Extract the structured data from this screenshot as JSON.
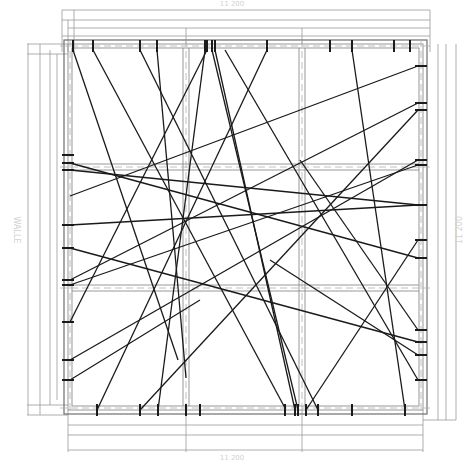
{
  "drawing": {
    "type": "structural plan - cable/tendon layout",
    "labels": {
      "top_dimension": "11 200",
      "bottom_dimension": "11 200",
      "left_dimension": "WALLE",
      "right_dimension": "11 200",
      "panel_marks": [
        "B1",
        "B2",
        "B3",
        "B4",
        "B5",
        "B6",
        "B7",
        "B8",
        "B9"
      ]
    },
    "colors": {
      "cable": "#1a1a1a",
      "grid": "#8c8c8c",
      "dimension": "#9a9a9a",
      "label": "#d2d2d2"
    },
    "slab": {
      "x1": 68,
      "y1": 44,
      "x2": 423,
      "y2": 410
    },
    "grid_x": [
      68,
      186,
      302,
      423
    ],
    "grid_y": [
      44,
      167,
      288,
      410
    ],
    "cables": [
      [
        [
          73,
          50
        ],
        [
          178,
          360
        ]
      ],
      [
        [
          93,
          50
        ],
        [
          285,
          408
        ]
      ],
      [
        [
          140,
          50
        ],
        [
          318,
          410
        ]
      ],
      [
        [
          157,
          50
        ],
        [
          186,
          378
        ]
      ],
      [
        [
          205,
          50
        ],
        [
          158,
          410
        ]
      ],
      [
        [
          207,
          50
        ],
        [
          70,
          322
        ]
      ],
      [
        [
          212,
          50
        ],
        [
          298,
          410
        ]
      ],
      [
        [
          215,
          50
        ],
        [
          295,
          410
        ]
      ],
      [
        [
          267,
          50
        ],
        [
          97,
          410
        ]
      ],
      [
        [
          352,
          50
        ],
        [
          405,
          410
        ]
      ],
      [
        [
          418,
          66
        ],
        [
          70,
          196
        ]
      ],
      [
        [
          418,
          103
        ],
        [
          70,
          280
        ]
      ],
      [
        [
          418,
          160
        ],
        [
          70,
          360
        ]
      ],
      [
        [
          418,
          165
        ],
        [
          70,
          285
        ]
      ],
      [
        [
          418,
          205
        ],
        [
          70,
          225
        ]
      ],
      [
        [
          418,
          258
        ],
        [
          70,
          163
        ]
      ],
      [
        [
          418,
          342
        ],
        [
          70,
          248
        ]
      ],
      [
        [
          418,
          355
        ],
        [
          270,
          260
        ]
      ],
      [
        [
          418,
          330
        ],
        [
          300,
          160
        ]
      ],
      [
        [
          418,
          110
        ],
        [
          140,
          410
        ]
      ],
      [
        [
          306,
          410
        ],
        [
          418,
          240
        ]
      ],
      [
        [
          70,
          170
        ],
        [
          418,
          205
        ]
      ],
      [
        [
          225,
          50
        ],
        [
          418,
          380
        ]
      ],
      [
        [
          70,
          380
        ],
        [
          200,
          300
        ]
      ]
    ],
    "anchors_top": [
      73,
      93,
      140,
      157,
      205,
      207,
      212,
      215,
      267,
      330,
      352,
      394,
      410
    ],
    "anchors_bottom": [
      97,
      140,
      158,
      186,
      200,
      285,
      295,
      298,
      306,
      318,
      352,
      405
    ],
    "anchors_left": [
      155,
      163,
      170,
      225,
      248,
      280,
      285,
      322,
      360,
      380
    ],
    "anchors_right": [
      66,
      103,
      110,
      160,
      165,
      205,
      240,
      258,
      330,
      342,
      355,
      380
    ]
  }
}
